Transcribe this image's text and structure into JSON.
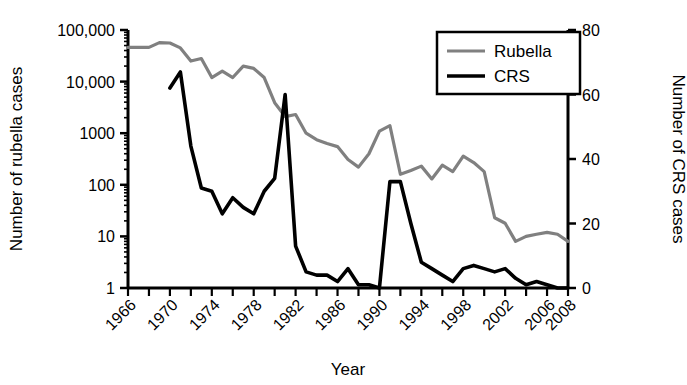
{
  "chart_data": {
    "type": "line",
    "title": "",
    "xlabel": "Year",
    "ylabel": "Number of rubella cases",
    "y2label": "Number of CRS cases",
    "grid": false,
    "legend_position": "top-right",
    "xlim": [
      1966,
      2008
    ],
    "xticks": [
      1966,
      1970,
      1974,
      1978,
      1982,
      1986,
      1990,
      1994,
      1998,
      2002,
      2006,
      2008
    ],
    "xtick_labels": [
      "1966",
      "1970",
      "1974",
      "1978",
      "1982",
      "1986",
      "1990",
      "1994",
      "1998",
      "2002",
      "2006",
      "2008"
    ],
    "xminor_step": 2,
    "yscale": "log",
    "ylim": [
      1,
      100000
    ],
    "yticks": [
      1,
      10,
      100,
      1000,
      10000,
      100000
    ],
    "ytick_labels": [
      "1",
      "10",
      "100",
      "1000",
      "10,000",
      "100,000"
    ],
    "y2lim": [
      0,
      80
    ],
    "y2ticks": [
      0,
      20,
      40,
      60,
      80
    ],
    "y2tick_labels": [
      "0",
      "20",
      "40",
      "60",
      "80"
    ],
    "series": [
      {
        "name": "Rubella",
        "axis": "left",
        "color": "#808080",
        "linewidth": 3.2,
        "x": [
          1966,
          1967,
          1968,
          1969,
          1970,
          1971,
          1972,
          1973,
          1974,
          1975,
          1976,
          1977,
          1978,
          1979,
          1980,
          1981,
          1982,
          1983,
          1984,
          1985,
          1986,
          1987,
          1988,
          1989,
          1990,
          1991,
          1992,
          1993,
          1994,
          1995,
          1996,
          1997,
          1998,
          1999,
          2000,
          2001,
          2002,
          2003,
          2004,
          2005,
          2006,
          2007,
          2008
        ],
        "values": [
          46000,
          46000,
          46000,
          57000,
          56000,
          45000,
          25000,
          28000,
          12000,
          16000,
          12000,
          20000,
          18000,
          12000,
          3900,
          2100,
          2300,
          1000,
          750,
          630,
          550,
          310,
          220,
          400,
          1100,
          1400,
          160,
          190,
          230,
          130,
          240,
          180,
          360,
          270,
          180,
          23,
          18,
          8,
          10,
          11,
          12,
          11,
          8
        ]
      },
      {
        "name": "CRS",
        "axis": "right",
        "color": "#000000",
        "linewidth": 3.6,
        "x": [
          1970,
          1971,
          1972,
          1973,
          1974,
          1975,
          1976,
          1977,
          1978,
          1979,
          1980,
          1981,
          1982,
          1983,
          1984,
          1985,
          1986,
          1987,
          1988,
          1989,
          1990,
          1991,
          1992,
          1993,
          1994,
          1995,
          1996,
          1997,
          1998,
          1999,
          2000,
          2001,
          2002,
          2003,
          2004,
          2005,
          2006,
          2007,
          2008
        ],
        "values": [
          62,
          67,
          44,
          31,
          30,
          23,
          28,
          25,
          23,
          30,
          34,
          60,
          13,
          5,
          4,
          4,
          2,
          6,
          1,
          1,
          0,
          33,
          33,
          20,
          8,
          6,
          4,
          2,
          6,
          7,
          6,
          5,
          6,
          3,
          1,
          2,
          1,
          0,
          0
        ]
      }
    ],
    "legend_entries": [
      {
        "label": "Rubella",
        "color": "#808080"
      },
      {
        "label": "CRS",
        "color": "#000000"
      }
    ]
  }
}
